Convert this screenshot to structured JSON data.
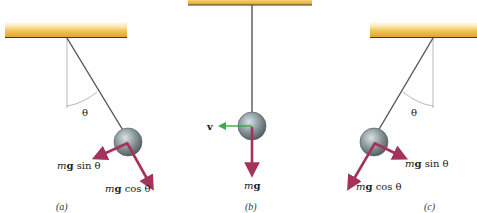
{
  "figure": {
    "colors": {
      "ceiling": "#e9b43e",
      "ceiling_edge": "#3a3a3a",
      "string": "#555555",
      "bob": "#7c8a8e",
      "force_arrow": "#a3335a",
      "velocity_arrow": "#3ea84c",
      "reference_line": "#888888"
    },
    "panels": [
      {
        "id": "a",
        "caption": "(a)",
        "angle_label": "θ",
        "labels": {
          "tangential": "mg sin θ",
          "radial": "mg cos θ"
        },
        "tangential_parts": {
          "m": "m",
          "g": "g",
          "rest": " sin θ"
        },
        "radial_parts": {
          "m": "m",
          "g": "g",
          "rest": " cos θ"
        }
      },
      {
        "id": "b",
        "caption": "(b)",
        "labels": {
          "velocity": "v",
          "weight": "mg"
        },
        "weight_parts": {
          "m": "m",
          "g": "g"
        }
      },
      {
        "id": "c",
        "caption": "(c)",
        "angle_label": "θ",
        "labels": {
          "tangential": "mg sin θ",
          "radial": "mg cos θ"
        },
        "tangential_parts": {
          "m": "m",
          "g": "g",
          "rest": " sin θ"
        },
        "radial_parts": {
          "m": "m",
          "g": "g",
          "rest": " cos θ"
        }
      }
    ]
  }
}
